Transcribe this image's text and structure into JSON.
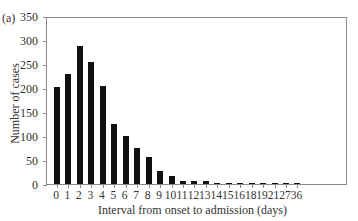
{
  "panel_label": "(a)",
  "chart_data": {
    "type": "bar",
    "title": "",
    "xlabel": "Interval from onset to admission (days)",
    "ylabel": "Number of cases",
    "ylim": [
      0,
      350
    ],
    "yticks": [
      0,
      50,
      100,
      150,
      200,
      250,
      300,
      350
    ],
    "grid": false,
    "legend": null,
    "categories": [
      "0",
      "1",
      "2",
      "3",
      "4",
      "5",
      "6",
      "7",
      "8",
      "9",
      "10",
      "11",
      "12",
      "13",
      "14",
      "15",
      "16",
      "18",
      "19",
      "21",
      "27",
      "36"
    ],
    "values": [
      203,
      229,
      287,
      254,
      204,
      125,
      101,
      75,
      56,
      28,
      16,
      7,
      7,
      6,
      3,
      1,
      1,
      1,
      1,
      1,
      1,
      1
    ]
  },
  "colors": {
    "bar": "#111111",
    "axis": "#8a8a8a"
  }
}
